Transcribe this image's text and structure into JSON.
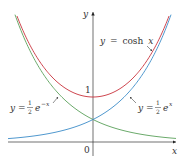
{
  "chart_data": {
    "type": "line",
    "title": "",
    "xlabel": "x",
    "ylabel": "y",
    "origin_label": "0",
    "y_tick_labels": [
      "1"
    ],
    "xlim": [
      -2.1,
      2.0
    ],
    "ylim": [
      -0.4,
      3.1
    ],
    "grid": false,
    "legend": "none (inline annotations with arrows)",
    "series": [
      {
        "name": "y = cosh x",
        "color": "#c8323c",
        "function": "cosh(x)",
        "x": [
          -1.7,
          -1.5,
          -1.0,
          -0.5,
          0,
          0.5,
          1.0,
          1.5,
          1.7
        ],
        "values": [
          2.83,
          2.35,
          1.54,
          1.13,
          1.0,
          1.13,
          1.54,
          2.35,
          2.83
        ]
      },
      {
        "name": "y = ½e^x",
        "color": "#3c8cc8",
        "function": "0.5*exp(x)",
        "x": [
          -2.0,
          -1.5,
          -1.0,
          -0.5,
          0,
          0.5,
          1.0,
          1.5,
          1.7
        ],
        "values": [
          0.07,
          0.11,
          0.18,
          0.3,
          0.5,
          0.82,
          1.36,
          2.24,
          2.74
        ]
      },
      {
        "name": "y = ½e^(-x)",
        "color": "#5aa05a",
        "function": "0.5*exp(-x)",
        "x": [
          -1.7,
          -1.5,
          -1.0,
          -0.5,
          0,
          0.5,
          1.0,
          1.5,
          2.0
        ],
        "values": [
          2.74,
          2.24,
          1.36,
          0.82,
          0.5,
          0.3,
          0.18,
          0.11,
          0.07
        ]
      }
    ],
    "annotations": [
      {
        "text": "y = cosh x",
        "position": "upper right",
        "points_to": "cosh curve"
      },
      {
        "text": "y = ½e^−x",
        "position": "left",
        "points_to": "½e^−x curve"
      },
      {
        "text": "y = ½e^x",
        "position": "right",
        "points_to": "½e^x curve"
      }
    ]
  },
  "labels": {
    "y_axis": "y",
    "x_axis": "x",
    "origin": "0",
    "tick_one": "1",
    "cosh_y": "y",
    "cosh_eq": "=",
    "cosh_fn": "cosh",
    "cosh_x": "x",
    "left_y": "y",
    "left_eq": "=",
    "left_num": "1",
    "left_den": "2",
    "left_e": "e",
    "left_exp": "−x",
    "right_y": "y",
    "right_eq": "=",
    "right_num": "1",
    "right_den": "2",
    "right_e": "e",
    "right_exp": "x"
  }
}
